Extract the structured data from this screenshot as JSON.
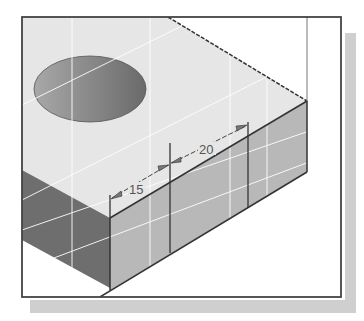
{
  "figure": {
    "dimensions": [
      {
        "label": "15",
        "value": 15
      },
      {
        "label": "20",
        "value": 20
      }
    ],
    "colors": {
      "top_face": "#e6e6e6",
      "front_face": "#b8b8b8",
      "side_face": "#6e6e6e",
      "hole": "#8a8a8a",
      "frame_border": "#444444",
      "shadow": "#cfcfcf",
      "grid_lines": "#ffffff"
    }
  }
}
